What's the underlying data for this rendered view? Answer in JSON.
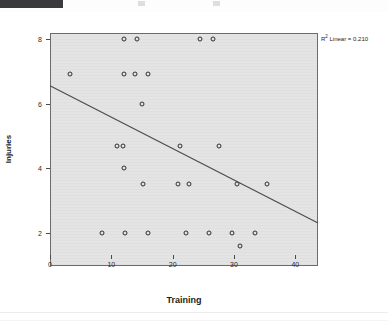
{
  "window": {
    "top_bar_color": "#3a3a3c"
  },
  "chart_data": {
    "type": "scatter",
    "title": "",
    "xlabel": "Training",
    "ylabel": "Injuries",
    "xlim": [
      0,
      43.7
    ],
    "ylim": [
      1.35,
      8.55
    ],
    "xticks": [
      0,
      10,
      20,
      30,
      40
    ],
    "xticklabels": [
      "0",
      "10",
      "20",
      "30",
      "40"
    ],
    "yticks": [
      2,
      4,
      6,
      8
    ],
    "yticklabels": [
      "2",
      "4",
      "6",
      "8"
    ],
    "grid": false,
    "legend": null,
    "annotation": "R² Linear = 0.210",
    "annotation_r": "R",
    "annotation_sup": "2",
    "annotation_rest": " Linear = 0.210",
    "plot_background": "#e3e3e3",
    "marker_edge_color": "#2f2f2f",
    "fit_line": {
      "type": "linear",
      "x_start": 0,
      "y_start": 6.55,
      "x_end": 43.7,
      "y_end": 2.31,
      "r_squared": 0.21,
      "color": "#4a4a4a"
    },
    "points": [
      {
        "x": 12.0,
        "y": 8.0
      },
      {
        "x": 14.2,
        "y": 8.0
      },
      {
        "x": 24.5,
        "y": 8.0
      },
      {
        "x": 26.6,
        "y": 8.0
      },
      {
        "x": 3.3,
        "y": 6.9
      },
      {
        "x": 12.1,
        "y": 6.9
      },
      {
        "x": 13.9,
        "y": 6.9
      },
      {
        "x": 16.0,
        "y": 6.9
      },
      {
        "x": 15.0,
        "y": 6.0
      },
      {
        "x": 10.9,
        "y": 4.7
      },
      {
        "x": 11.9,
        "y": 4.7
      },
      {
        "x": 21.2,
        "y": 4.7
      },
      {
        "x": 27.6,
        "y": 4.7
      },
      {
        "x": 12.0,
        "y": 4.0
      },
      {
        "x": 15.1,
        "y": 3.5
      },
      {
        "x": 20.8,
        "y": 3.5
      },
      {
        "x": 22.7,
        "y": 3.5
      },
      {
        "x": 30.5,
        "y": 3.5
      },
      {
        "x": 35.4,
        "y": 3.5
      },
      {
        "x": 8.5,
        "y": 2.0
      },
      {
        "x": 12.2,
        "y": 2.0
      },
      {
        "x": 16.0,
        "y": 2.0
      },
      {
        "x": 22.2,
        "y": 2.0
      },
      {
        "x": 26.0,
        "y": 2.0
      },
      {
        "x": 29.7,
        "y": 2.0
      },
      {
        "x": 33.5,
        "y": 2.0
      },
      {
        "x": 31.0,
        "y": 1.6
      }
    ]
  }
}
